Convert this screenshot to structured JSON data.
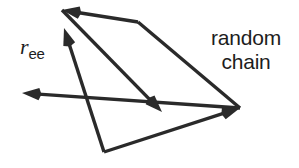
{
  "figure": {
    "width": 299,
    "height": 168,
    "background_color": "#ffffff",
    "stroke_color": "#2a2a2a",
    "text_color": "#1d1d1d",
    "stroke_width": 3.4
  },
  "labels": {
    "end_to_end_vector": {
      "base": "r",
      "subscript": "ee"
    },
    "random_chain": {
      "line1": "random",
      "line2": "chain"
    }
  },
  "chart_data": {
    "type": "diagram",
    "coordinate_space": {
      "x": [
        0,
        299
      ],
      "y": [
        0,
        168
      ],
      "y_axis": "down"
    },
    "vertices": [
      {
        "id": "A",
        "x": 62,
        "y": 10,
        "role": "chain-start"
      },
      {
        "id": "B",
        "x": 162,
        "y": 112,
        "role": "chain-vertex"
      },
      {
        "id": "C",
        "x": 138,
        "y": 22,
        "role": "chain-vertex"
      },
      {
        "id": "D",
        "x": 240,
        "y": 108,
        "role": "chain-vertex"
      },
      {
        "id": "E",
        "x": 22,
        "y": 93,
        "role": "chain-vertex"
      },
      {
        "id": "F",
        "x": 104,
        "y": 152,
        "role": "chain-end"
      },
      {
        "id": "G",
        "x": 64,
        "y": 28,
        "role": "ree-head"
      }
    ],
    "segments": [
      {
        "name": "chain-segment-1",
        "from": "C",
        "to": "A",
        "x1": 138,
        "y1": 22,
        "x2": 62,
        "y2": 10,
        "arrow_at_end": true,
        "kind": "chain"
      },
      {
        "name": "chain-segment-2",
        "from": "A",
        "to": "B",
        "x1": 62,
        "y1": 10,
        "x2": 162,
        "y2": 112,
        "arrow_at_end": true,
        "kind": "chain"
      },
      {
        "name": "chain-segment-3",
        "from": "C",
        "to": "D",
        "x1": 138,
        "y1": 22,
        "x2": 240,
        "y2": 108,
        "arrow_at_end": false,
        "kind": "chain"
      },
      {
        "name": "chain-segment-4",
        "from": "D",
        "to": "E",
        "x1": 240,
        "y1": 108,
        "x2": 22,
        "y2": 93,
        "arrow_at_end": true,
        "kind": "chain"
      },
      {
        "name": "chain-segment-5",
        "from": "F",
        "to": "D",
        "x1": 104,
        "y1": 152,
        "x2": 240,
        "y2": 108,
        "arrow_at_end": true,
        "kind": "chain"
      },
      {
        "name": "end-to-end-vector",
        "from": "F",
        "to": "G",
        "x1": 104,
        "y1": 152,
        "x2": 64,
        "y2": 28,
        "arrow_at_end": true,
        "kind": "ree"
      }
    ],
    "arrowheads": [
      {
        "name": "arrowhead-chain-start",
        "tip_x": 62,
        "tip_y": 10,
        "angle_deg": 189
      },
      {
        "name": "arrowhead-ree",
        "tip_x": 64,
        "tip_y": 28,
        "angle_deg": 252
      },
      {
        "name": "arrowhead-upper-right",
        "tip_x": 138,
        "tip_y": 22,
        "angle_deg": 320
      },
      {
        "name": "arrowhead-left",
        "tip_x": 22,
        "tip_y": 93,
        "angle_deg": 184
      },
      {
        "name": "arrowhead-middle",
        "tip_x": 162,
        "tip_y": 112,
        "angle_deg": 46
      },
      {
        "name": "arrowhead-lower-right",
        "tip_x": 240,
        "tip_y": 108,
        "angle_deg": 18
      }
    ]
  }
}
